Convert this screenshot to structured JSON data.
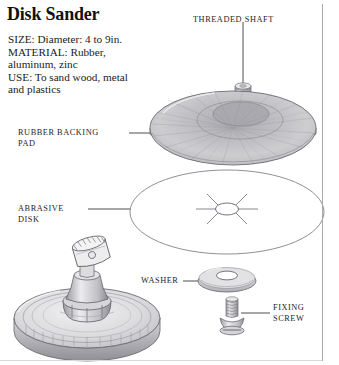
{
  "document": {
    "title": "Disk Sander",
    "specs": [
      "SIZE: Diameter: 4 to 9in.",
      "MATERIAL: Rubber,",
      "aluminum, zinc",
      "USE: To sand wood, metal",
      "and plastics"
    ]
  },
  "callouts": {
    "threaded_shaft": {
      "label": "THREADED SHAFT"
    },
    "rubber_backing_pad": {
      "line1": "RUBBER BACKING",
      "line2": "PAD"
    },
    "abrasive_disk": {
      "line1": "ABRASIVE",
      "line2": "DISK"
    },
    "washer": {
      "label": "WASHER"
    },
    "fixing_screw": {
      "line1": "FIXING",
      "line2": "SCREW"
    }
  },
  "colors": {
    "ink": "#242424",
    "title": "#111111",
    "leader_line": "#3a3a3a",
    "outline": "#6f6f77",
    "pad_fill_light": "#cfcfd2",
    "pad_fill_mid": "#b4b4b8",
    "pad_fill_dark": "#9a9aa0",
    "metal_light": "#e4e4e6",
    "metal_dark": "#8d8d93",
    "background": "#ffffff",
    "frame": "#aaaaaa"
  },
  "figure": {
    "type": "exploded-assembly-illustration",
    "parts": [
      "threaded-shaft",
      "rubber-backing-pad",
      "abrasive-disk",
      "washer",
      "fixing-screw",
      "drill-chuck-assembly"
    ]
  }
}
